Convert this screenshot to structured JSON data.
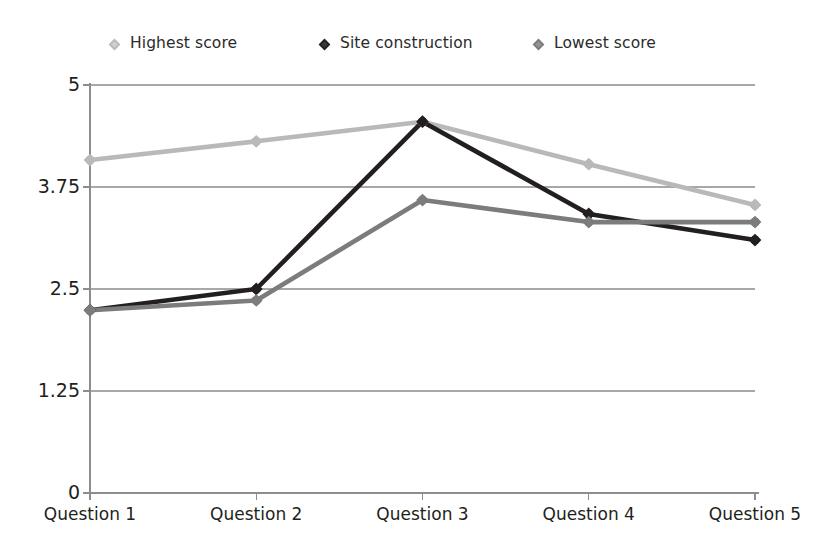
{
  "chart_data": {
    "type": "line",
    "title": "",
    "xlabel": "",
    "ylabel": "",
    "categories": [
      "Question 1",
      "Question 2",
      "Question 3",
      "Question 4",
      "Question 5"
    ],
    "ylim": [
      0,
      5
    ],
    "yticks": [
      "0",
      "1.25",
      "2.5",
      "3.75",
      "5"
    ],
    "ytick_values": [
      0,
      1.25,
      2.5,
      3.75,
      5
    ],
    "grid": "horizontal",
    "legend_position": "top",
    "series": [
      {
        "name": "Highest score",
        "color": "#b9b9b9",
        "marker": "diamond",
        "values": [
          4.08,
          4.31,
          4.55,
          4.03,
          3.53
        ]
      },
      {
        "name": "Site construction",
        "color": "#231f20",
        "marker": "diamond",
        "values": [
          2.24,
          2.5,
          4.55,
          3.42,
          3.1
        ]
      },
      {
        "name": "Lowest score",
        "color": "#7c7c7c",
        "marker": "diamond",
        "values": [
          2.24,
          2.36,
          3.59,
          3.32,
          3.32
        ]
      }
    ]
  },
  "legend": {
    "items": [
      {
        "label": "Highest score",
        "color": "#b9b9b9",
        "icon": "diamond-marker-icon"
      },
      {
        "label": "Site construction",
        "color": "#231f20",
        "icon": "diamond-marker-icon"
      },
      {
        "label": "Lowest score",
        "color": "#7c7c7c",
        "icon": "diamond-marker-icon"
      }
    ]
  },
  "axes": {
    "y": {
      "labels": [
        "5",
        "3.75",
        "2.5",
        "1.25",
        "0"
      ]
    },
    "x": {
      "labels": [
        "Question 1",
        "Question 2",
        "Question 3",
        "Question 4",
        "Question 5"
      ]
    }
  },
  "colors": {
    "axis": "#8d8d8d",
    "grid": "#a8a8a8",
    "text": "#231f20",
    "background": "#ffffff"
  }
}
